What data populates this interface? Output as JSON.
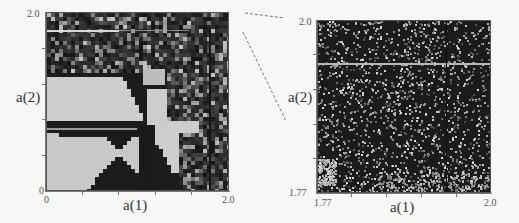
{
  "chart_data": [
    {
      "type": "heatmap",
      "title": "",
      "xlabel": "a(1)",
      "ylabel": "a(2)",
      "xlim": [
        0,
        2.0
      ],
      "ylim": [
        0,
        2.0
      ],
      "x_tick_labels": [
        "0",
        "2.0"
      ],
      "y_tick_labels": [
        "0",
        "2.0"
      ],
      "grid": false,
      "colormap": "grayscale",
      "description": "Full parameter plane: light-gray bow-tie regions crossing at center (~1.0, 0.9), dark triangular regions, noisy checkered region for a(1) > ~1.5 and a(2) > ~1.4; bright horizontal line near a(2)=1.85"
    },
    {
      "type": "heatmap",
      "title": "",
      "xlabel": "a(1)",
      "ylabel": "a(2)",
      "xlim": [
        1.77,
        2.0
      ],
      "ylim": [
        1.77,
        2.0
      ],
      "x_tick_labels": [
        "1.77",
        "2.0"
      ],
      "y_tick_labels": [
        "1.77",
        "2.0"
      ],
      "grid": false,
      "colormap": "grayscale",
      "description": "Zoomed region of the upper-right corner: dark speckled noise with a bright horizontal line near a(2)=1.95 and lighter patch at lower left"
    }
  ],
  "left_panel": {
    "xlabel": "a(1)",
    "ylabel": "a(2)",
    "x_min_label": "0",
    "x_max_label": "2.0",
    "y_min_label": "0",
    "y_max_label": "2.0"
  },
  "right_panel": {
    "xlabel": "a(1)",
    "ylabel": "a(2)",
    "x_min_label": "1.77",
    "x_max_label": "2.0",
    "y_min_label": "1.77",
    "y_max_label": "2.0"
  },
  "colors": {
    "background": "#f7f7f5",
    "dark": "#1c1c1c",
    "light": "#cfcfcd",
    "axis": "#777777"
  }
}
